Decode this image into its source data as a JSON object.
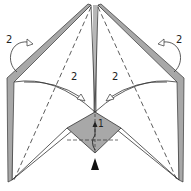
{
  "diagram": {
    "type": "origami-fold-step",
    "colors": {
      "paper": "#ffffff",
      "reverse": "#a8a8a8",
      "line": "#333333"
    },
    "labels": {
      "top_left_step": "2",
      "top_right_step": "2",
      "inner_left_step": "2",
      "inner_right_step": "2",
      "center_step": "1"
    },
    "symbols": {
      "mountain_fold_arrow_left": "turn-over-arrow",
      "mountain_fold_arrow_right": "turn-over-arrow",
      "valley_fold_arrow_left": "valley-fold-arrow",
      "valley_fold_arrow_right": "valley-fold-arrow",
      "bottom_pointer": "push-arrow"
    }
  }
}
